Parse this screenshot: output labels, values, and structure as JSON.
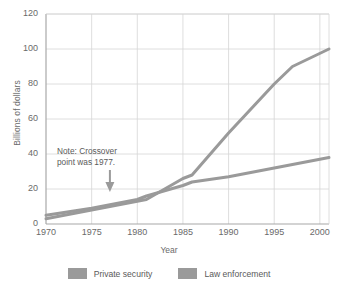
{
  "chart_data": {
    "type": "line",
    "title": "",
    "xlabel": "Year",
    "ylabel": "Billions of dollars",
    "xlim": [
      1970,
      2001
    ],
    "ylim": [
      0,
      120
    ],
    "yticks": [
      0,
      20,
      40,
      60,
      80,
      100,
      120
    ],
    "xticks": [
      1970,
      1975,
      1980,
      1985,
      1990,
      1995,
      2000
    ],
    "grid": true,
    "legend_position": "bottom",
    "annotations": [
      {
        "text": "Note: Crossover point was 1977.",
        "line1": "Note: Crossover",
        "line2": "point was 1977.",
        "x": 1977,
        "y": 10,
        "arrow": "down-arrow"
      }
    ],
    "x": [
      1970,
      1975,
      1977,
      1980,
      1981,
      1985,
      1986,
      1990,
      1995,
      1997,
      2001
    ],
    "series": [
      {
        "name": "Private security",
        "color": "#9a9a9a",
        "values": [
          3,
          8,
          10,
          13,
          14,
          26,
          28,
          52,
          80,
          90,
          100
        ]
      },
      {
        "name": "Law enforcement",
        "color": "#9a9a9a",
        "values": [
          5,
          9,
          11,
          14,
          16,
          22,
          24,
          27,
          32,
          34,
          38
        ]
      }
    ]
  },
  "axes": {
    "y_label": "Billions of dollars",
    "x_label": "Year",
    "y_ticks": [
      "0",
      "20",
      "40",
      "60",
      "80",
      "100",
      "120"
    ],
    "x_ticks": [
      "1970",
      "1975",
      "1980",
      "1985",
      "1990",
      "1995",
      "2000"
    ]
  },
  "note": {
    "line1": "Note: Crossover",
    "line2": "point was 1977."
  },
  "legend": {
    "items": [
      {
        "label": "Private security",
        "color": "#9a9a9a"
      },
      {
        "label": "Law enforcement",
        "color": "#9a9a9a"
      }
    ]
  },
  "colors": {
    "line": "#9a9a9a",
    "grid": "#d6d6d6",
    "axis": "#a8a8a8",
    "text": "#5a5a5a"
  }
}
